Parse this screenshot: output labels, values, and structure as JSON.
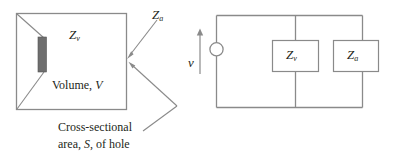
{
  "figure": {
    "background_color": "#ffffff",
    "line_color": "#8a8a8a",
    "text_color": "#231f20",
    "hole_fill_color": "#6e6e6e"
  },
  "left_diagram": {
    "name": "cavity-volume-sketch",
    "cavity_label": {
      "symbol": "Z",
      "subscript": "v"
    },
    "hole_impedance_label": {
      "symbol": "Z",
      "subscript": "a"
    },
    "volume_label_text": "Volume, ",
    "volume_label_symbol": "V",
    "caption_line_1": "Cross-sectional",
    "caption_line_2_prefix": "area, ",
    "caption_line_2_symbol": "S",
    "caption_line_2_suffix": ", of hole"
  },
  "right_diagram": {
    "name": "equivalent-circuit",
    "source_label": "v",
    "box_1": {
      "symbol": "Z",
      "subscript": "v"
    },
    "box_2": {
      "symbol": "Z",
      "subscript": "a"
    }
  }
}
